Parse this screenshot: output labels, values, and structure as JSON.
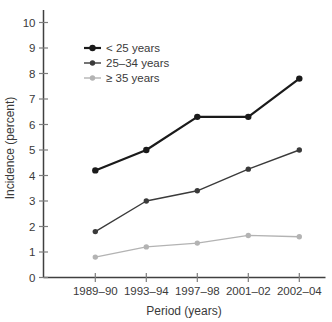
{
  "chart_data": {
    "type": "line",
    "title": "",
    "categories": [
      "1989–90",
      "1993–94",
      "1997–98",
      "2001–02",
      "2002–04"
    ],
    "series": [
      {
        "name": "< 25 years",
        "values": [
          4.2,
          5.0,
          6.3,
          6.3,
          7.8
        ],
        "color": "#1a1a1a",
        "line_width": 2.2,
        "marker_radius": 3.2
      },
      {
        "name": "25–34 years",
        "values": [
          1.8,
          3.0,
          3.4,
          4.25,
          5.0
        ],
        "color": "#3a3a3a",
        "line_width": 1.4,
        "marker_radius": 2.7
      },
      {
        "name": "≥ 35 years",
        "values": [
          0.8,
          1.2,
          1.35,
          1.65,
          1.6
        ],
        "color": "#b3b3b3",
        "line_width": 1.4,
        "marker_radius": 2.7
      }
    ],
    "xlabel": "Period (years)",
    "ylabel": "Incidence (percent)",
    "ylim": [
      0,
      10
    ],
    "y_ticks": [
      0,
      1,
      2,
      3,
      4,
      5,
      6,
      7,
      8,
      9,
      10
    ],
    "legend_position": "top-left",
    "grid": false,
    "colors": {
      "axis_line": "#404040",
      "tick_mark": "#7d7d7d",
      "text": "#3a3a3a",
      "background": "#ffffff"
    }
  }
}
